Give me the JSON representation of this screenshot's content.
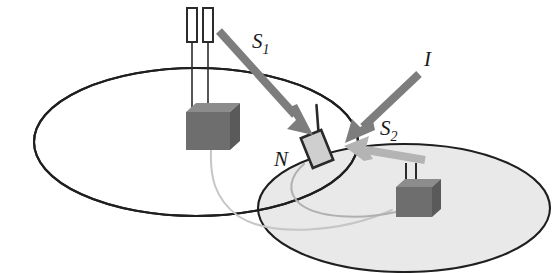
{
  "figure": {
    "background_color": "#ffffff",
    "labels": [
      {
        "id": "s1",
        "base": "S",
        "subscript": "1",
        "name": "signal-one-label",
        "x": 252,
        "y": 48,
        "meaning": "desired signal from left base station"
      },
      {
        "id": "i",
        "base": "I",
        "subscript": "",
        "name": "interference-label",
        "x": 424,
        "y": 66,
        "meaning": "interference arrow"
      },
      {
        "id": "s2",
        "base": "S",
        "subscript": "2",
        "name": "signal-two-label",
        "x": 380,
        "y": 135,
        "meaning": "signal toward right base station"
      },
      {
        "id": "n",
        "base": "N",
        "subscript": "",
        "name": "node-label",
        "x": 274,
        "y": 166,
        "meaning": "mobile node / handset"
      }
    ],
    "cells": [
      {
        "id": "cell-left",
        "name": "coverage-cell-left",
        "cx": 196,
        "cy": 142,
        "rx": 162,
        "ry": 74,
        "fill": "#ffffff",
        "stroke": "#1f1f1f",
        "stroke_width": 2.1
      },
      {
        "id": "cell-right",
        "name": "coverage-cell-right",
        "cx": 404,
        "cy": 208,
        "rx": 146,
        "ry": 64,
        "fill": "#e9e9e9",
        "stroke": "#1f1f1f",
        "stroke_width": 2.1
      }
    ],
    "base_stations": [
      {
        "id": "bs-left",
        "name": "base-station-left",
        "box_x": 196,
        "box_y": 108,
        "box_w": 34,
        "box_h": 40,
        "depth": 10,
        "antenna_count": 2,
        "antenna_top": 8,
        "fill_front": "#6e6e6e",
        "fill_top": "#8c8c8c",
        "fill_side": "#5a5a5a",
        "antenna_style": "tall-rectangles"
      },
      {
        "id": "bs-right",
        "name": "base-station-right",
        "box_x": 398,
        "box_y": 185,
        "box_w": 32,
        "box_h": 32,
        "depth": 9,
        "antenna_count": 2,
        "antenna_top": 163,
        "fill_front": "#6e6e6e",
        "fill_top": "#8c8c8c",
        "fill_side": "#5a5a5a",
        "antenna_style": "thin-lines"
      }
    ],
    "mobile_node": {
      "id": "node-n",
      "name": "mobile-node-handset",
      "x": 306,
      "y": 133,
      "w": 22,
      "h": 32,
      "rotation_deg": -22,
      "fill": "#cfcfcf",
      "stroke": "#2a2a2a",
      "antenna": true
    },
    "arrows": [
      {
        "id": "arrow-s1",
        "name": "arrow-signal-one",
        "from_x": 219,
        "from_y": 31,
        "to_x": 311,
        "to_y": 133,
        "color": "#7d7d7d",
        "shaft_width": 8,
        "head_len": 22,
        "head_w": 20,
        "label_ref": "s1"
      },
      {
        "id": "arrow-i",
        "name": "arrow-interference",
        "from_x": 419,
        "from_y": 74,
        "to_x": 349,
        "to_y": 140,
        "color": "#7d7d7d",
        "shaft_width": 8,
        "head_len": 22,
        "head_w": 20,
        "label_ref": "i"
      },
      {
        "id": "arrow-s2",
        "name": "arrow-signal-two",
        "from_x": 423,
        "from_y": 159,
        "to_x": 345,
        "to_y": 147,
        "color": "#b4b4b4",
        "shaft_width": 8,
        "head_len": 20,
        "head_w": 22,
        "label_ref": "s2"
      }
    ],
    "cables": [
      {
        "id": "cable-left-bs",
        "name": "cable-left-base-station",
        "color": "#c6c6c6",
        "width": 2,
        "path": "M 211 150 C 210 176 214 198 238 216 C 272 238 342 232 392 210"
      },
      {
        "id": "cable-node",
        "name": "cable-mobile-node",
        "color": "#b0b0b0",
        "width": 2,
        "path": "M 304 164 C 290 176 286 192 300 204 C 318 218 360 220 396 212"
      }
    ]
  }
}
